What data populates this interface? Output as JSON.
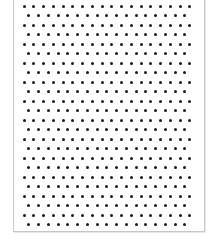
{
  "sheet": {
    "pattern": "staggered-dot-grid",
    "dot_color": "#1a1a1a",
    "border_color": "#c8c8c8",
    "rows": 24,
    "even_row_dots": 18,
    "odd_row_dots": 17,
    "first_x": 24,
    "first_y": 6,
    "col_pitch": 9.75,
    "row_pitch": 9.5
  }
}
